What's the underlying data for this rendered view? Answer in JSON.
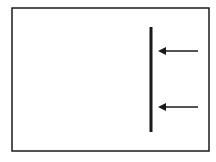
{
  "diagram": {
    "background": "#ffffff",
    "stroke_color": "#1a1a1a",
    "frame": {
      "x": 12,
      "y": 8,
      "width": 197,
      "height": 143,
      "stroke_width": 1.5
    },
    "wall": {
      "x": 151,
      "y1": 27,
      "y2": 132,
      "stroke_width": 3
    },
    "arrows": [
      {
        "label": "",
        "direction": "left",
        "x_tail": 198,
        "x_head": 158,
        "y": 51
      },
      {
        "label": "",
        "direction": "left",
        "x_tail": 198,
        "x_head": 158,
        "y": 107
      }
    ]
  }
}
